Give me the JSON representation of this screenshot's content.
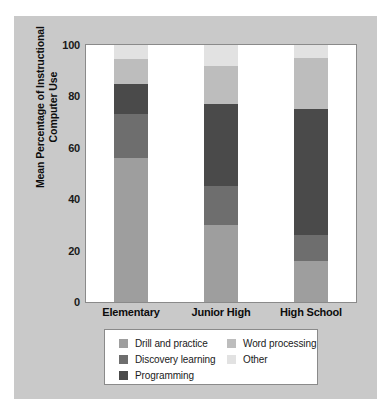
{
  "chart_data": {
    "type": "bar",
    "subtype": "stacked-bar",
    "title": "",
    "xlabel": "",
    "ylabel": "Mean Percentage of Instructional Computer Use",
    "categories": [
      "Elementary",
      "Junior High",
      "High School"
    ],
    "ylim": [
      0,
      100
    ],
    "yticks": [
      0,
      20,
      40,
      60,
      80,
      100
    ],
    "ytick_labels": [
      "0",
      "20",
      "40",
      "60",
      "80",
      "100"
    ],
    "grid": false,
    "legend_position": "below-plot",
    "stack_order_bottom_to_top": [
      "Drill and practice",
      "Discovery learning",
      "Programming",
      "Word processing",
      "Other"
    ],
    "series": [
      {
        "name": "Drill and practice",
        "color": "#9e9e9e",
        "values": [
          56,
          30,
          16
        ]
      },
      {
        "name": "Discovery learning",
        "color": "#6e6e6e",
        "values": [
          17,
          15,
          10
        ]
      },
      {
        "name": "Programming",
        "color": "#4a4a4a",
        "values": [
          12,
          32,
          49
        ]
      },
      {
        "name": "Word processing",
        "color": "#bdbdbd",
        "values": [
          9.5,
          15,
          20
        ]
      },
      {
        "name": "Other",
        "color": "#e2e2e2",
        "values": [
          5.5,
          8,
          5
        ]
      }
    ]
  },
  "legend": {
    "entries": [
      {
        "label": "Drill and practice",
        "color": "#9e9e9e",
        "column": "left"
      },
      {
        "label": "Discovery learning",
        "color": "#6e6e6e",
        "column": "left"
      },
      {
        "label": "Programming",
        "color": "#4a4a4a",
        "column": "left"
      },
      {
        "label": "Word processing",
        "color": "#bdbdbd",
        "column": "right"
      },
      {
        "label": "Other",
        "color": "#e2e2e2",
        "column": "right"
      }
    ]
  },
  "colors": {
    "figure_background": "#c9c9c9",
    "plot_background": "#ffffff",
    "page_background": "#ffffff",
    "axis_line": "#8a8a8a",
    "text": "#0d0d0d"
  }
}
